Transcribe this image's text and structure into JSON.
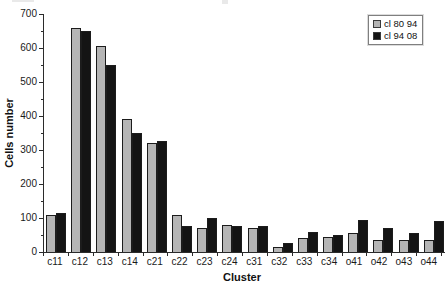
{
  "page": {
    "background": "#ffffff"
  },
  "colors": {
    "axis": "#2b2b2b",
    "text": "#1a1a1a",
    "legend_border": "#7f7f7f",
    "series_gray": "#b5b5b5",
    "series_black": "#141414"
  },
  "chart_data": {
    "type": "bar",
    "title": "",
    "xlabel": "Cluster",
    "ylabel": "Cells number",
    "ylim": [
      0,
      700
    ],
    "yticks": [
      0,
      100,
      200,
      300,
      400,
      500,
      600,
      700
    ],
    "minor_tick_interval": 50,
    "grid": false,
    "legend_position": "top-right",
    "categories": [
      "c11",
      "c12",
      "c13",
      "c14",
      "c21",
      "c22",
      "c23",
      "c24",
      "c31",
      "c32",
      "c33",
      "c34",
      "o41",
      "o42",
      "o43",
      "o44"
    ],
    "series": [
      {
        "name": "cl 80 94",
        "color": "#b5b5b5",
        "values": [
          110,
          660,
          605,
          390,
          320,
          110,
          70,
          80,
          70,
          15,
          40,
          45,
          55,
          35,
          35,
          35
        ]
      },
      {
        "name": "cl 94 08",
        "color": "#141414",
        "values": [
          115,
          650,
          550,
          350,
          325,
          75,
          100,
          75,
          75,
          25,
          60,
          50,
          95,
          70,
          55,
          90
        ]
      }
    ]
  }
}
